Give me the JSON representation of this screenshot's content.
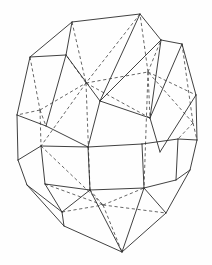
{
  "figure": {
    "type": "line-drawing",
    "canvas": {
      "width": 212,
      "height": 265
    },
    "colors": {
      "background": "#fefefe",
      "visible_edge": "#2b2b2b",
      "hidden_edge": "#4a4a4a"
    },
    "stroke": {
      "visible_width": 0.9,
      "hidden_width": 0.85,
      "hidden_dash": "3.2 2.6"
    }
  },
  "geometry": {
    "vertex_count": 24,
    "visible_edge_count": 38,
    "hidden_edge_count": 24,
    "vertices": {
      "top_front_left": [
        72,
        22
      ],
      "top_front_right": [
        140,
        14
      ],
      "top_back_right": [
        161,
        40
      ],
      "top_back_left": [
        66,
        55
      ],
      "upper_left_outer": [
        30,
        57
      ],
      "upper_right_outer": [
        182,
        44
      ],
      "upper_left_mid": [
        17,
        115
      ],
      "upper_right_mid": [
        196,
        95
      ],
      "ring_left_front": [
        46,
        126
      ],
      "ring_left_back": [
        100,
        101
      ],
      "ring_mid_front": [
        88,
        147
      ],
      "ring_mid_back": [
        150,
        118
      ],
      "ring_right_front": [
        160,
        152
      ],
      "ring_right_back": [
        193,
        123
      ],
      "eq_left_upper": [
        41,
        146
      ],
      "eq_left_lower": [
        45,
        184
      ],
      "eq_c1_upper": [
        88,
        147
      ],
      "eq_c1_lower": [
        90,
        190
      ],
      "eq_c2_upper": [
        142,
        144
      ],
      "eq_c2_lower": [
        144,
        188
      ],
      "eq_right_upper": [
        178,
        139
      ],
      "eq_right_lower": [
        176,
        180
      ],
      "low_left_outer": [
        18,
        160
      ],
      "low_right_outer": [
        197,
        140
      ],
      "low_left_corner": [
        27,
        185
      ],
      "low_right_corner": [
        190,
        170
      ],
      "bottom_front_left": [
        64,
        226
      ],
      "bottom_front_right": [
        122,
        252
      ],
      "bottom_back_right": [
        166,
        213
      ],
      "bottom_back_left": [
        62,
        212
      ]
    },
    "visible_edges": [
      [
        [
          72,
          22
        ],
        [
          140,
          14
        ]
      ],
      [
        [
          140,
          14
        ],
        [
          161,
          40
        ]
      ],
      [
        [
          161,
          40
        ],
        [
          182,
          44
        ]
      ],
      [
        [
          182,
          44
        ],
        [
          196,
          95
        ]
      ],
      [
        [
          196,
          95
        ],
        [
          197,
          140
        ]
      ],
      [
        [
          197,
          140
        ],
        [
          190,
          170
        ]
      ],
      [
        [
          190,
          170
        ],
        [
          166,
          213
        ]
      ],
      [
        [
          166,
          213
        ],
        [
          122,
          252
        ]
      ],
      [
        [
          122,
          252
        ],
        [
          64,
          226
        ]
      ],
      [
        [
          64,
          226
        ],
        [
          27,
          185
        ]
      ],
      [
        [
          27,
          185
        ],
        [
          18,
          160
        ]
      ],
      [
        [
          18,
          160
        ],
        [
          17,
          115
        ]
      ],
      [
        [
          17,
          115
        ],
        [
          30,
          57
        ]
      ],
      [
        [
          30,
          57
        ],
        [
          72,
          22
        ]
      ],
      [
        [
          72,
          22
        ],
        [
          66,
          55
        ]
      ],
      [
        [
          66,
          55
        ],
        [
          30,
          57
        ]
      ],
      [
        [
          66,
          55
        ],
        [
          100,
          101
        ]
      ],
      [
        [
          100,
          101
        ],
        [
          161,
          40
        ]
      ],
      [
        [
          140,
          14
        ],
        [
          100,
          101
        ]
      ],
      [
        [
          66,
          55
        ],
        [
          46,
          126
        ]
      ],
      [
        [
          46,
          126
        ],
        [
          17,
          115
        ]
      ],
      [
        [
          46,
          126
        ],
        [
          88,
          147
        ]
      ],
      [
        [
          88,
          147
        ],
        [
          100,
          101
        ]
      ],
      [
        [
          100,
          101
        ],
        [
          150,
          118
        ]
      ],
      [
        [
          150,
          118
        ],
        [
          161,
          40
        ]
      ],
      [
        [
          150,
          118
        ],
        [
          182,
          44
        ]
      ],
      [
        [
          150,
          118
        ],
        [
          160,
          152
        ]
      ],
      [
        [
          160,
          152
        ],
        [
          196,
          95
        ]
      ],
      [
        [
          41,
          146
        ],
        [
          88,
          147
        ]
      ],
      [
        [
          88,
          147
        ],
        [
          142,
          144
        ]
      ],
      [
        [
          142,
          144
        ],
        [
          178,
          139
        ]
      ],
      [
        [
          41,
          146
        ],
        [
          45,
          184
        ]
      ],
      [
        [
          88,
          147
        ],
        [
          90,
          190
        ]
      ],
      [
        [
          142,
          144
        ],
        [
          144,
          188
        ]
      ],
      [
        [
          178,
          139
        ],
        [
          176,
          180
        ]
      ],
      [
        [
          45,
          184
        ],
        [
          90,
          190
        ]
      ],
      [
        [
          90,
          190
        ],
        [
          144,
          188
        ]
      ],
      [
        [
          144,
          188
        ],
        [
          176,
          180
        ]
      ],
      [
        [
          41,
          146
        ],
        [
          18,
          160
        ]
      ],
      [
        [
          178,
          139
        ],
        [
          197,
          140
        ]
      ],
      [
        [
          45,
          184
        ],
        [
          62,
          212
        ]
      ],
      [
        [
          62,
          212
        ],
        [
          27,
          185
        ]
      ],
      [
        [
          62,
          212
        ],
        [
          64,
          226
        ]
      ],
      [
        [
          90,
          190
        ],
        [
          62,
          212
        ]
      ],
      [
        [
          144,
          188
        ],
        [
          166,
          213
        ]
      ],
      [
        [
          176,
          180
        ],
        [
          190,
          170
        ]
      ],
      [
        [
          90,
          190
        ],
        [
          122,
          252
        ]
      ],
      [
        [
          144,
          188
        ],
        [
          122,
          252
        ]
      ]
    ],
    "hidden_edges": [
      [
        [
          72,
          22
        ],
        [
          86,
          83
        ]
      ],
      [
        [
          140,
          14
        ],
        [
          86,
          83
        ]
      ],
      [
        [
          86,
          83
        ],
        [
          66,
          55
        ]
      ],
      [
        [
          86,
          83
        ],
        [
          148,
          72
        ]
      ],
      [
        [
          148,
          72
        ],
        [
          161,
          40
        ]
      ],
      [
        [
          148,
          72
        ],
        [
          140,
          14
        ]
      ],
      [
        [
          86,
          83
        ],
        [
          150,
          118
        ]
      ],
      [
        [
          148,
          72
        ],
        [
          196,
          95
        ]
      ],
      [
        [
          148,
          72
        ],
        [
          150,
          118
        ]
      ],
      [
        [
          30,
          57
        ],
        [
          40,
          110
        ]
      ],
      [
        [
          40,
          110
        ],
        [
          17,
          115
        ]
      ],
      [
        [
          40,
          110
        ],
        [
          46,
          126
        ]
      ],
      [
        [
          40,
          110
        ],
        [
          86,
          83
        ]
      ],
      [
        [
          40,
          110
        ],
        [
          41,
          146
        ]
      ],
      [
        [
          182,
          44
        ],
        [
          193,
          123
        ]
      ],
      [
        [
          193,
          123
        ],
        [
          197,
          140
        ]
      ],
      [
        [
          193,
          123
        ],
        [
          178,
          139
        ]
      ],
      [
        [
          193,
          123
        ],
        [
          148,
          72
        ]
      ],
      [
        [
          86,
          83
        ],
        [
          90,
          190
        ]
      ],
      [
        [
          148,
          72
        ],
        [
          144,
          188
        ]
      ],
      [
        [
          45,
          184
        ],
        [
          103,
          205
        ]
      ],
      [
        [
          103,
          205
        ],
        [
          144,
          188
        ]
      ],
      [
        [
          103,
          205
        ],
        [
          90,
          190
        ]
      ],
      [
        [
          103,
          205
        ],
        [
          122,
          252
        ]
      ],
      [
        [
          62,
          212
        ],
        [
          103,
          205
        ]
      ],
      [
        [
          103,
          205
        ],
        [
          166,
          213
        ]
      ],
      [
        [
          41,
          146
        ],
        [
          103,
          205
        ]
      ],
      [
        [
          86,
          83
        ],
        [
          41,
          146
        ]
      ]
    ]
  }
}
